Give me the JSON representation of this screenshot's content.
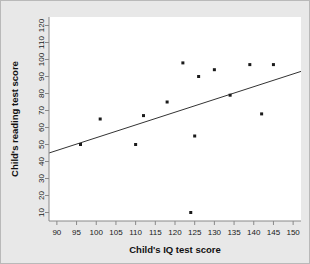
{
  "chart_data": {
    "type": "scatter",
    "title": "",
    "xlabel": "Child's IQ test score",
    "ylabel": "Child's reading test score",
    "xlim": [
      88,
      152
    ],
    "ylim": [
      5,
      125
    ],
    "xticks": [
      90,
      95,
      100,
      105,
      110,
      115,
      120,
      125,
      130,
      135,
      140,
      145,
      150
    ],
    "yticks": [
      10,
      20,
      30,
      40,
      50,
      60,
      70,
      80,
      90,
      100,
      110,
      120
    ],
    "grid": false,
    "legend": null,
    "marker": "square",
    "marker_color": "#1a1a1a",
    "points": [
      {
        "x": 96,
        "y": 50
      },
      {
        "x": 101,
        "y": 65
      },
      {
        "x": 110,
        "y": 50
      },
      {
        "x": 112,
        "y": 67
      },
      {
        "x": 118,
        "y": 75
      },
      {
        "x": 122,
        "y": 98
      },
      {
        "x": 124,
        "y": 10
      },
      {
        "x": 125,
        "y": 55
      },
      {
        "x": 126,
        "y": 90
      },
      {
        "x": 130,
        "y": 94
      },
      {
        "x": 134,
        "y": 79
      },
      {
        "x": 139,
        "y": 97
      },
      {
        "x": 142,
        "y": 68
      },
      {
        "x": 145,
        "y": 97
      }
    ],
    "fit_line": {
      "type": "linear-regression",
      "x1": 88,
      "y1": 45,
      "x2": 152,
      "y2": 93,
      "color": "#333333"
    }
  },
  "figure": {
    "background_color": "#e8e8e8",
    "panel_color": "#ffffff",
    "border_color": "#b9b9b9",
    "axis_color": "#888888"
  }
}
